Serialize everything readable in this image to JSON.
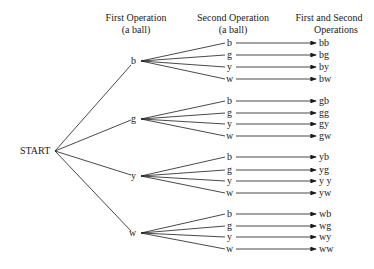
{
  "headers": {
    "first": {
      "line1": "First Operation",
      "line2": "(a ball)"
    },
    "second": {
      "line1": "Second Operation",
      "line2": "(a ball)"
    },
    "result": {
      "line1": "First and Second",
      "line2": "Operations"
    }
  },
  "root": "START",
  "groups": [
    {
      "first": "b",
      "second": [
        "b",
        "g",
        "y",
        "w"
      ],
      "results": [
        "bb",
        "bg",
        "by",
        "bw"
      ]
    },
    {
      "first": "g",
      "second": [
        "b",
        "g",
        "y",
        "w"
      ],
      "results": [
        "gb",
        "gg",
        "gy",
        "gw"
      ]
    },
    {
      "first": "y",
      "second": [
        "b",
        "g",
        "y",
        "w"
      ],
      "results": [
        "yb",
        "yg",
        "y y",
        "yw"
      ]
    },
    {
      "first": "w",
      "second": [
        "b",
        "g",
        "y",
        "w"
      ],
      "results": [
        "wb",
        "wg",
        "wy",
        "ww"
      ]
    }
  ]
}
